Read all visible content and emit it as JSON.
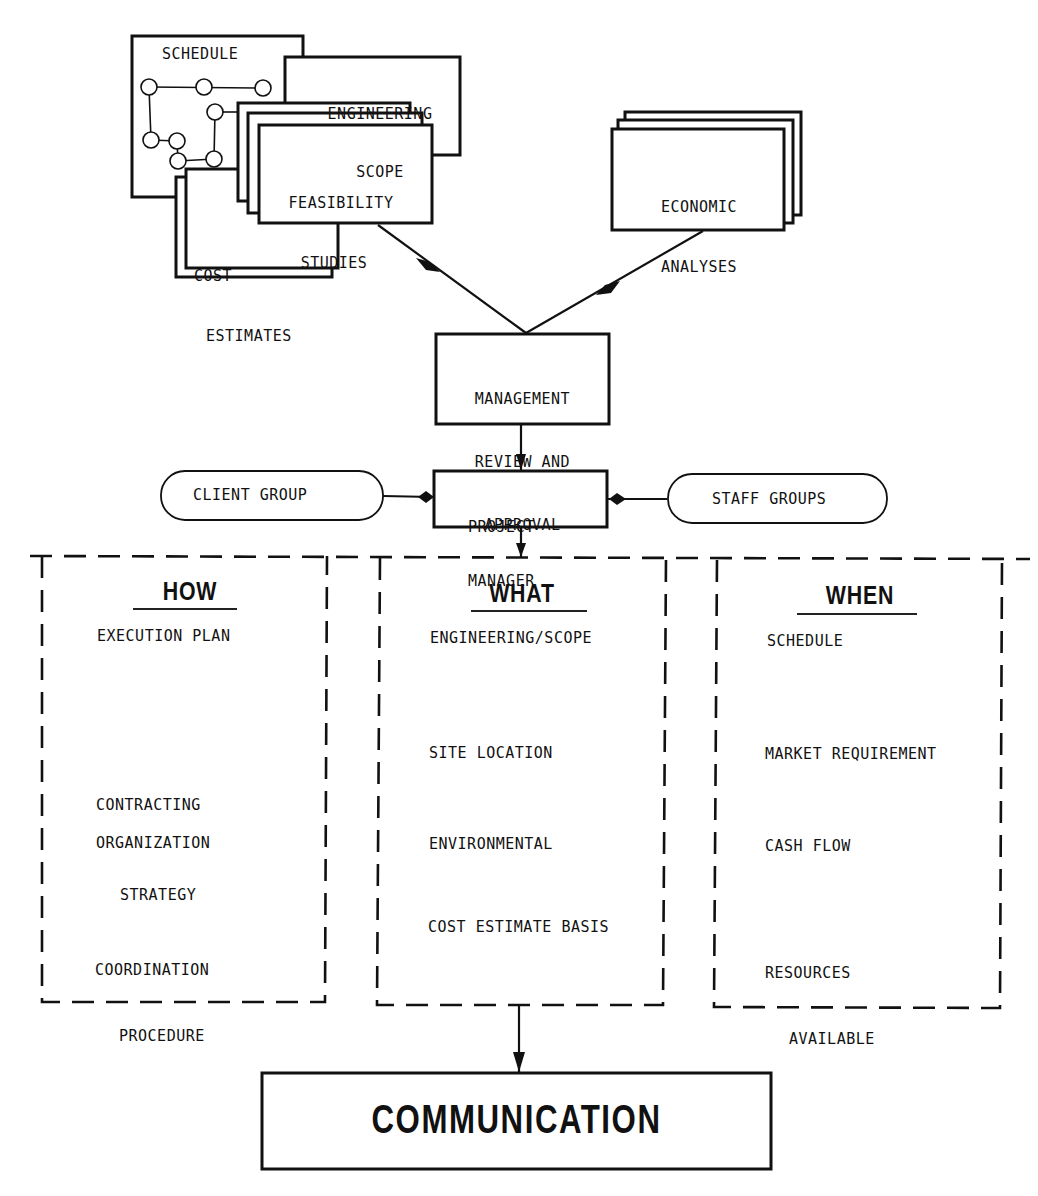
{
  "colors": {
    "ink": "#111111",
    "paper": "#ffffff"
  },
  "top_cluster": {
    "schedule": {
      "label": "SCHEDULE"
    },
    "engineering_scope": {
      "line1": "ENGINEERING",
      "line2": "SCOPE"
    },
    "feasibility_studies": {
      "line1": "FEASIBILITY",
      "line2": "STUDIES"
    },
    "cost_estimates": {
      "line1": "COST",
      "line2": "ESTIMATES"
    }
  },
  "economic_analyses": {
    "line1": "ECONOMIC",
    "line2": "ANALYSES"
  },
  "management_review": {
    "line1": "MANAGEMENT",
    "line2": "REVIEW AND",
    "line3": "APPROVAL"
  },
  "project_manager": {
    "line1": "PROJECT",
    "line2": "MANAGER"
  },
  "client_group": {
    "label": "CLIENT GROUP"
  },
  "staff_groups": {
    "label": "STAFF GROUPS"
  },
  "columns": {
    "how": {
      "heading": "HOW",
      "items": [
        {
          "line1": "EXECUTION PLAN"
        },
        {
          "line1": "CONTRACTING",
          "line2": "STRATEGY"
        },
        {
          "line1": "ORGANIZATION"
        },
        {
          "line1": "COORDINATION",
          "line2": "PROCEDURE"
        }
      ]
    },
    "what": {
      "heading": "WHAT",
      "items": [
        {
          "line1": "ENGINEERING/SCOPE"
        },
        {
          "line1": "SITE LOCATION"
        },
        {
          "line1": "ENVIRONMENTAL"
        },
        {
          "line1": "COST ESTIMATE BASIS"
        }
      ]
    },
    "when": {
      "heading": "WHEN",
      "items": [
        {
          "line1": "SCHEDULE"
        },
        {
          "line1": "MARKET REQUIREMENT"
        },
        {
          "line1": "CASH FLOW"
        },
        {
          "line1": "RESOURCES",
          "line2": "AVAILABLE"
        }
      ]
    }
  },
  "communication": {
    "label": "COMMUNICATION"
  }
}
